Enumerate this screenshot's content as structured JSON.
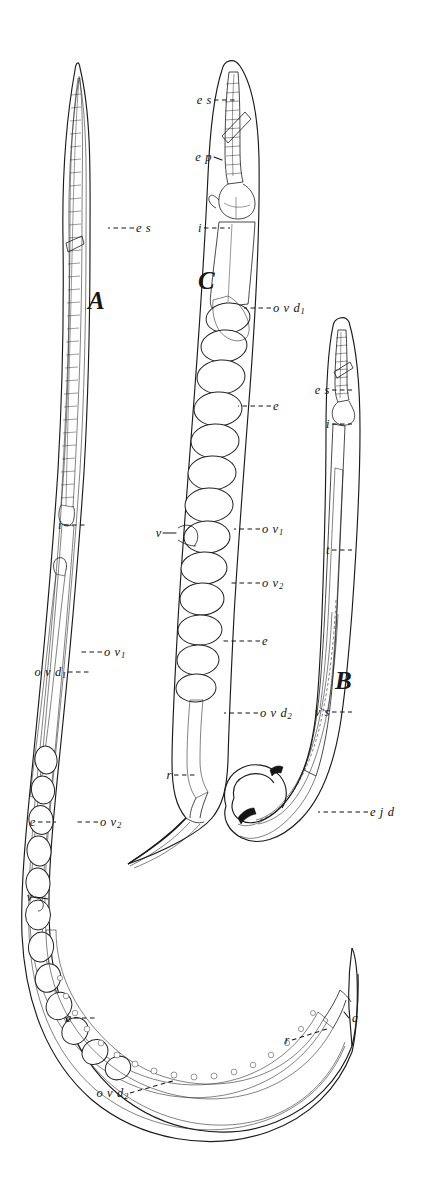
{
  "plate": {
    "title": "Nematode anatomy plate",
    "background_color": "#ffffff",
    "ink_color": "#1b1b1b",
    "width": 441,
    "height": 1180,
    "style": "engraved line drawing"
  },
  "figures": [
    {
      "id": "A",
      "letter": "A",
      "caption": "A",
      "description": "female nematode, whole body, curved J shape",
      "letter_pos": {
        "x": 88,
        "y": 288
      }
    },
    {
      "id": "B",
      "letter": "B",
      "caption": "B",
      "description": "male nematode with hooked tail",
      "letter_pos": {
        "x": 335,
        "y": 668
      }
    },
    {
      "id": "C",
      "letter": "C",
      "caption": "C",
      "description": "female nematode, enlarged, egg-filled uterus",
      "letter_pos": {
        "x": 198,
        "y": 268
      }
    }
  ],
  "labels": [
    {
      "key": "es_a",
      "text": "e s",
      "sub": "",
      "figure": "A",
      "anchor": "left",
      "x": 136,
      "y": 228,
      "meaning": "esophagus"
    },
    {
      "key": "i_a",
      "text": "i",
      "sub": "",
      "figure": "A",
      "anchor": "right",
      "x": 62,
      "y": 525,
      "meaning": "intestine"
    },
    {
      "key": "ov1_a",
      "text": "o v",
      "sub": "1",
      "figure": "A",
      "anchor": "left",
      "x": 104,
      "y": 652,
      "meaning": "ovary 1"
    },
    {
      "key": "ovd1_a",
      "text": "o v d",
      "sub": "1",
      "figure": "A",
      "anchor": "right",
      "x": 66,
      "y": 672,
      "meaning": "oviduct 1"
    },
    {
      "key": "e_a1",
      "text": "e",
      "sub": "",
      "figure": "A",
      "anchor": "right",
      "x": 36,
      "y": 822,
      "meaning": "egg"
    },
    {
      "key": "ov2_a",
      "text": "o v",
      "sub": "2",
      "figure": "A",
      "anchor": "left",
      "x": 100,
      "y": 822,
      "meaning": "ovary 2"
    },
    {
      "key": "v_a",
      "text": "v",
      "sub": "",
      "figure": "A",
      "anchor": "right",
      "x": 33,
      "y": 897,
      "meaning": "vulva"
    },
    {
      "key": "e_a2",
      "text": "e",
      "sub": "",
      "figure": "A",
      "anchor": "right",
      "x": 72,
      "y": 1018,
      "meaning": "egg"
    },
    {
      "key": "ovd2_a",
      "text": "o v d",
      "sub": "2",
      "figure": "A",
      "anchor": "right",
      "x": 128,
      "y": 1093,
      "meaning": "oviduct 2"
    },
    {
      "key": "r_a",
      "text": "r",
      "sub": "",
      "figure": "A",
      "anchor": "right",
      "x": 290,
      "y": 1040,
      "meaning": "rectum"
    },
    {
      "key": "a_a",
      "text": "a",
      "sub": "",
      "figure": "A",
      "anchor": "left",
      "x": 352,
      "y": 1018,
      "meaning": "anus"
    },
    {
      "key": "es_c",
      "text": "e s",
      "sub": "",
      "figure": "C",
      "anchor": "right",
      "x": 212,
      "y": 100,
      "meaning": "esophagus"
    },
    {
      "key": "ep_c",
      "text": "e p",
      "sub": "",
      "figure": "C",
      "anchor": "right",
      "x": 212,
      "y": 157,
      "meaning": "esophageal pouch"
    },
    {
      "key": "i_c",
      "text": "i",
      "sub": "",
      "figure": "C",
      "anchor": "right",
      "x": 202,
      "y": 228,
      "meaning": "intestine"
    },
    {
      "key": "ovd1_c",
      "text": "o v d",
      "sub": "1",
      "figure": "C",
      "anchor": "left",
      "x": 273,
      "y": 308,
      "meaning": "oviduct 1"
    },
    {
      "key": "e_c1",
      "text": "e",
      "sub": "",
      "figure": "C",
      "anchor": "left",
      "x": 273,
      "y": 406,
      "meaning": "egg"
    },
    {
      "key": "v_c",
      "text": "v",
      "sub": "",
      "figure": "C",
      "anchor": "right",
      "x": 162,
      "y": 533,
      "meaning": "vulva"
    },
    {
      "key": "ov1_c",
      "text": "o v",
      "sub": "1",
      "figure": "C",
      "anchor": "left",
      "x": 262,
      "y": 529,
      "meaning": "ovary 1"
    },
    {
      "key": "ov2_c",
      "text": "o v",
      "sub": "2",
      "figure": "C",
      "anchor": "left",
      "x": 262,
      "y": 583,
      "meaning": "ovary 2"
    },
    {
      "key": "e_c2",
      "text": "e",
      "sub": "",
      "figure": "C",
      "anchor": "left",
      "x": 262,
      "y": 641,
      "meaning": "egg"
    },
    {
      "key": "ovd2_c",
      "text": "o v d",
      "sub": "2",
      "figure": "C",
      "anchor": "left",
      "x": 260,
      "y": 713,
      "meaning": "oviduct 2"
    },
    {
      "key": "r_c",
      "text": "r",
      "sub": "",
      "figure": "C",
      "anchor": "right",
      "x": 172,
      "y": 775,
      "meaning": "rectum"
    },
    {
      "key": "es_b",
      "text": "e s",
      "sub": "",
      "figure": "B",
      "anchor": "right",
      "x": 330,
      "y": 390,
      "meaning": "esophagus"
    },
    {
      "key": "i_b",
      "text": "i",
      "sub": "",
      "figure": "B",
      "anchor": "right",
      "x": 330,
      "y": 424,
      "meaning": "intestine"
    },
    {
      "key": "t_b",
      "text": "t",
      "sub": "",
      "figure": "B",
      "anchor": "right",
      "x": 330,
      "y": 550,
      "meaning": "testis"
    },
    {
      "key": "vs_b",
      "text": "v s",
      "sub": "",
      "figure": "B",
      "anchor": "right",
      "x": 330,
      "y": 712,
      "meaning": "vesicula seminalis"
    },
    {
      "key": "ejd_b",
      "text": "e j d",
      "sub": "",
      "figure": "B",
      "anchor": "left",
      "x": 370,
      "y": 812,
      "meaning": "ejaculatory duct"
    }
  ]
}
